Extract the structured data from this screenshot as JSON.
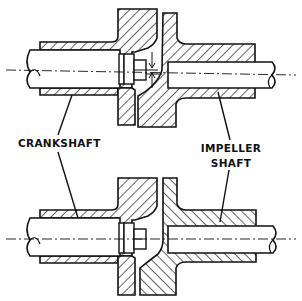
{
  "figure": {
    "type": "technical cross-section drawing",
    "views": [
      {
        "id": "top",
        "description": "coupling with misaligned (offset) shafts, offset dimension arrows shown"
      },
      {
        "id": "bottom",
        "description": "coupling with aligned shafts"
      }
    ]
  },
  "labels": {
    "crankshaft": "CRANKSHAFT",
    "impeller_line1": "IMPELLER",
    "impeller_line2": "SHAFT"
  },
  "colors": {
    "ink": "#111111",
    "background": "#ffffff"
  }
}
